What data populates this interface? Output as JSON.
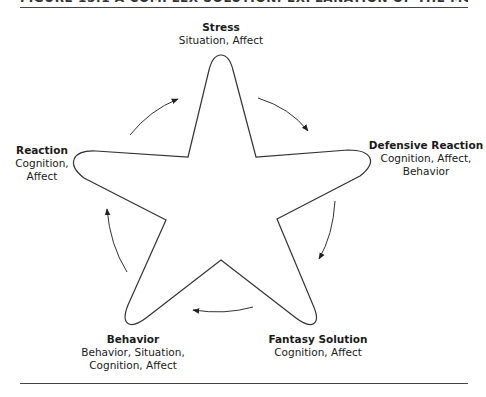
{
  "figure": {
    "title": "FIGURE 15.1 A COMPLEX SOLUTION: EXPLANATION OF THE MODEL"
  },
  "nodes": [
    {
      "id": "stress",
      "title": "Stress",
      "lines": [
        "Situation, Affect"
      ]
    },
    {
      "id": "defensive-reaction",
      "title": "Defensive Reaction",
      "lines": [
        "Cognition, Affect,",
        "Behavior"
      ]
    },
    {
      "id": "fantasy-solution",
      "title": "Fantasy Solution",
      "lines": [
        "Cognition, Affect"
      ]
    },
    {
      "id": "behavior",
      "title": "Behavior",
      "lines": [
        "Behavior, Situation,",
        "Cognition, Affect"
      ]
    },
    {
      "id": "reaction",
      "title": "Reaction",
      "lines": [
        "Cognition,",
        "Affect"
      ]
    }
  ],
  "cycle": {
    "direction": "clockwise",
    "order": [
      "Stress",
      "Defensive Reaction",
      "Fantasy Solution",
      "Behavior",
      "Reaction"
    ]
  },
  "colors": {
    "stroke": "#333333",
    "text": "#1a1a1a",
    "background": "#ffffff"
  }
}
